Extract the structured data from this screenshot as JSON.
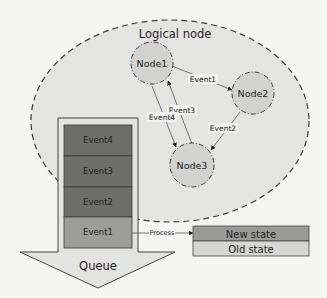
{
  "diagram": {
    "container": {
      "label": "Logical node"
    },
    "nodes": [
      {
        "id": "node1",
        "label": "Node1"
      },
      {
        "id": "node2",
        "label": "Node2"
      },
      {
        "id": "node3",
        "label": "Node3"
      }
    ],
    "edges": [
      {
        "from": "Node1",
        "to": "Node2",
        "label": "Event1"
      },
      {
        "from": "Node2",
        "to": "Node3",
        "label": "Event2"
      },
      {
        "from": "Node3",
        "to": "Node1",
        "label": "Event3"
      },
      {
        "from": "Node1",
        "to": "Node3",
        "label": "Event4"
      }
    ],
    "queue": {
      "label": "Queue",
      "items": [
        "Event4",
        "Event3",
        "Event2",
        "Event1"
      ]
    },
    "process": {
      "label": "Process"
    },
    "state": {
      "new": "New state",
      "old": "Old state"
    }
  },
  "colors": {
    "background": "#f5f5f3",
    "ellipse_fill": "#e4e4e3",
    "node_fill": "#d2d2d0",
    "queue_dark": "#6e6e6c",
    "queue_light": "#9c9c9a",
    "new_state": "#9a9a98",
    "old_state": "#d6d6d4"
  }
}
